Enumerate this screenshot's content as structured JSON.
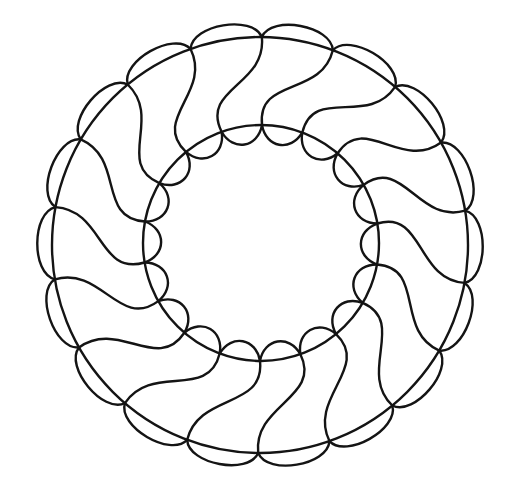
{
  "figure": {
    "title": "",
    "type": "guilloche-rosette-ring",
    "canvas": {
      "width": 512,
      "height": 487,
      "background": "#ffffff"
    },
    "stroke": {
      "color": "#141414",
      "width": 2.4
    },
    "center": {
      "x": 260,
      "y": 245
    },
    "outer_circle": {
      "radius": 208
    },
    "inner_circle": {
      "cx": 261,
      "cy": 243,
      "radius": 118
    },
    "petals": {
      "count": 18,
      "start_angle_deg": -89.5,
      "outer_scallop_peak_radius": 224,
      "inner_scallop_dip_radius": 102,
      "twist_deg": -20,
      "outer_control_inset": 48,
      "inner_control_outset": 48
    },
    "components": [
      {
        "name": "outer-circle",
        "label": "Outer ring circle"
      },
      {
        "name": "inner-circle",
        "label": "Inner ring circle"
      },
      {
        "name": "outer-scallops",
        "label": "Outer scalloped lobes (18)"
      },
      {
        "name": "inner-scallops",
        "label": "Inner scalloped lobes (18)"
      },
      {
        "name": "twist-waves",
        "label": "S-shaped connecting waves (18)"
      }
    ]
  }
}
